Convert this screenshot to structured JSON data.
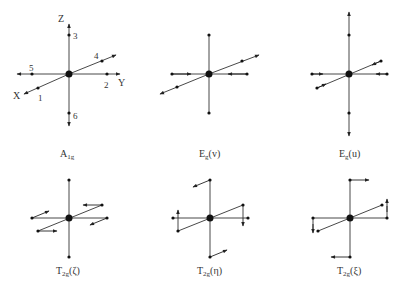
{
  "figure": {
    "colors": {
      "ink": "#333333",
      "background": "#ffffff"
    },
    "axes_labels": {
      "x": "X",
      "y": "Y",
      "z": "Z"
    },
    "atom_numbers": [
      "1",
      "2",
      "3",
      "4",
      "5",
      "6"
    ],
    "panels": [
      {
        "id": "A1g",
        "main": "A",
        "sub": "1g",
        "suffix": "",
        "description": "breathing mode: all ligands displaced outward along axes"
      },
      {
        "id": "Eg_v",
        "main": "E",
        "sub": "g",
        "suffix": "(v)",
        "description": "in-plane Y ligands inward, X ligands outward"
      },
      {
        "id": "Eg_u",
        "main": "E",
        "sub": "g",
        "suffix": "(u)",
        "description": "Z ligands outward, X and Y ligands inward"
      },
      {
        "id": "T2g_zeta",
        "main": "T",
        "sub": "2g",
        "suffix": "(ζ)",
        "description": "shear in XY plane"
      },
      {
        "id": "T2g_eta",
        "main": "T",
        "sub": "2g",
        "suffix": "(η)",
        "description": "shear in XZ plane"
      },
      {
        "id": "T2g_xi",
        "main": "T",
        "sub": "2g",
        "suffix": "(ξ)",
        "description": "shear in YZ plane"
      }
    ]
  }
}
